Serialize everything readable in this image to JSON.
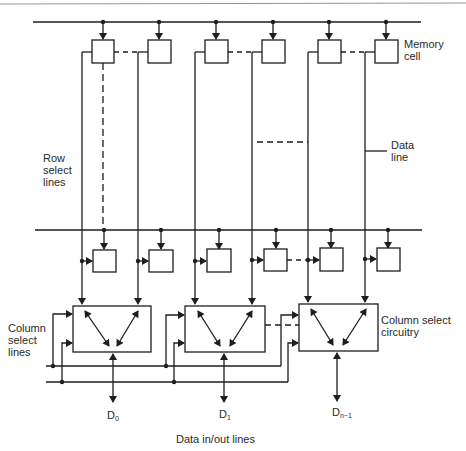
{
  "diagram": {
    "type": "memory-array-organization",
    "header_rule": true,
    "labels": {
      "memory_cell": "Memory\ncell",
      "row_select_lines": "Row\nselect\nlines",
      "data_line": "Data\nline",
      "column_select_lines": "Column\nselect\nlines",
      "column_select_circuitry": "Column select\ncircuitry",
      "data_in_out_lines": "Data in/out lines"
    },
    "outputs": [
      {
        "name": "D",
        "sub": "0"
      },
      {
        "name": "D",
        "sub": "1"
      },
      {
        "name": "D",
        "sub": "n−1"
      }
    ],
    "columns": 6,
    "rows_shown": 2,
    "column_select_blocks": 3,
    "colors": {
      "line": "#1e1e1e",
      "background": "#ffffff"
    }
  }
}
